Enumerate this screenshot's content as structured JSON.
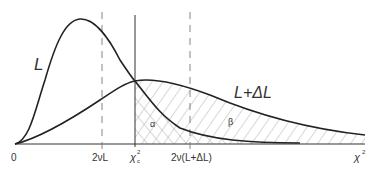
{
  "diagram": {
    "type": "chi-square distributions with critical value, type I and II error regions",
    "curves": [
      {
        "name": "L",
        "label": "L",
        "description": "chi-square density under null hypothesis, peaked left"
      },
      {
        "name": "L+dL",
        "label": "L+ΔL",
        "description": "chi-square density under alternative hypothesis, broader"
      }
    ],
    "x_axis": {
      "origin_label": "0",
      "end_label": "χ",
      "end_label_sup": "2",
      "ticks": [
        {
          "id": "mean_L",
          "label": "2νL",
          "style": "dashed"
        },
        {
          "id": "critical",
          "label": "χ",
          "sup": "2",
          "sub": "c",
          "style": "solid"
        },
        {
          "id": "mean_L_dL",
          "label": "2ν(L+ΔL)",
          "style": "dashed"
        }
      ]
    },
    "regions": [
      {
        "name": "alpha",
        "label": "α",
        "hatch": "cross-hatched",
        "description": "area under L right of χ²c"
      },
      {
        "name": "beta",
        "label": "β",
        "hatch": "diagonal",
        "description": "area under L+ΔL right of χ²c"
      }
    ],
    "colors": {
      "line": "#222222",
      "hatch": "#9a9a9a",
      "background": "#ffffff"
    }
  }
}
